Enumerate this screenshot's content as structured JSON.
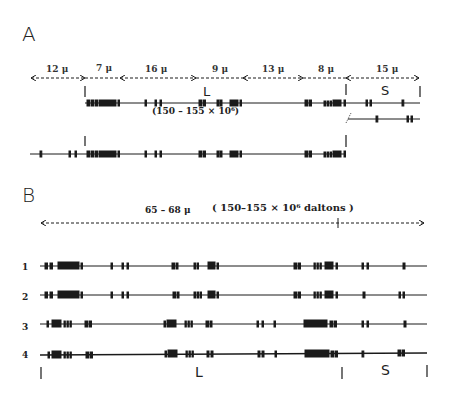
{
  "panel_a": {
    "label": "A",
    "segments": [
      {
        "label": "12 μ",
        "x1": 30,
        "x2": 85
      },
      {
        "label": "7 μ",
        "x1": 85,
        "x2": 120
      },
      {
        "label": "16 μ",
        "x1": 120,
        "x2": 195
      },
      {
        "label": "9 μ",
        "x1": 195,
        "x2": 243
      },
      {
        "label": "13 μ",
        "x1": 243,
        "x2": 303
      },
      {
        "label": "8 μ",
        "x1": 303,
        "x2": 346
      },
      {
        "label": "15 μ",
        "x1": 346,
        "x2": 420
      }
    ],
    "region_L": "L",
    "region_S": "S",
    "mw_label": "(150 – 155 × 10⁶)"
  },
  "panel_b": {
    "label": "B",
    "length_label": "65 – 68  μ",
    "mw_label": "( 150–155 × 10⁶ daltons )",
    "rows": [
      {
        "num": "1"
      },
      {
        "num": "2"
      },
      {
        "num": "3"
      },
      {
        "num": "4"
      }
    ],
    "region_L": "L",
    "region_S": "S"
  },
  "colors": {
    "ink": "#1a1a1a",
    "background": "#ffffff"
  }
}
